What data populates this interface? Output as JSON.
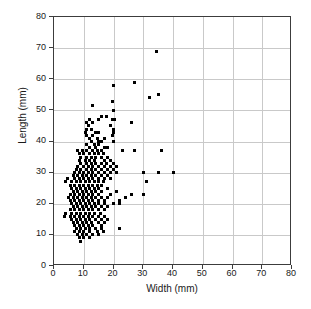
{
  "chart_data": {
    "type": "scatter",
    "title": "",
    "xlabel": "Width (mm)",
    "ylabel": "Length (mm)",
    "xlim": [
      0,
      80
    ],
    "ylim": [
      0,
      80
    ],
    "xticks": [
      0,
      10,
      20,
      30,
      40,
      50,
      60,
      70,
      80
    ],
    "yticks": [
      0,
      10,
      20,
      30,
      40,
      50,
      60,
      70,
      80
    ],
    "grid": true,
    "legend": null,
    "marker": {
      "shape": "square",
      "color": "#000000",
      "size_px": 3
    },
    "series": [
      {
        "name": "observations",
        "points": [
          [
            34.5,
            69
          ],
          [
            27,
            59
          ],
          [
            20,
            58
          ],
          [
            35,
            55
          ],
          [
            32,
            54
          ],
          [
            19.5,
            53
          ],
          [
            13,
            51.5
          ],
          [
            20,
            50
          ],
          [
            16,
            48
          ],
          [
            17.5,
            48
          ],
          [
            12,
            47
          ],
          [
            15,
            47
          ],
          [
            19.5,
            47
          ],
          [
            20.5,
            47
          ],
          [
            11,
            46
          ],
          [
            13,
            46
          ],
          [
            26,
            46
          ],
          [
            11.5,
            45
          ],
          [
            19,
            45
          ],
          [
            11,
            44
          ],
          [
            12.5,
            44
          ],
          [
            20,
            44
          ],
          [
            10.5,
            43
          ],
          [
            14,
            43
          ],
          [
            15,
            43
          ],
          [
            20,
            43
          ],
          [
            11,
            42
          ],
          [
            13,
            42
          ],
          [
            19.5,
            42
          ],
          [
            12,
            41
          ],
          [
            14.5,
            41
          ],
          [
            17,
            41
          ],
          [
            12.5,
            40
          ],
          [
            15,
            40
          ],
          [
            16,
            40
          ],
          [
            20,
            40
          ],
          [
            11,
            39
          ],
          [
            13.5,
            39
          ],
          [
            15,
            39
          ],
          [
            17,
            38
          ],
          [
            12,
            38
          ],
          [
            14,
            38
          ],
          [
            18,
            38
          ],
          [
            8,
            37
          ],
          [
            9.5,
            37
          ],
          [
            11,
            37
          ],
          [
            13,
            37
          ],
          [
            14.5,
            37
          ],
          [
            16,
            37
          ],
          [
            23,
            37
          ],
          [
            27,
            37
          ],
          [
            36,
            37
          ],
          [
            8.5,
            36
          ],
          [
            10,
            36
          ],
          [
            12,
            36
          ],
          [
            13.5,
            36
          ],
          [
            15,
            36
          ],
          [
            16.5,
            36
          ],
          [
            9,
            35
          ],
          [
            11,
            35
          ],
          [
            12.5,
            35
          ],
          [
            14,
            35
          ],
          [
            16,
            35
          ],
          [
            18,
            35
          ],
          [
            8.5,
            34
          ],
          [
            10.5,
            34
          ],
          [
            12,
            34
          ],
          [
            13.5,
            34
          ],
          [
            17,
            34
          ],
          [
            19,
            34
          ],
          [
            9,
            33
          ],
          [
            11,
            33
          ],
          [
            12.5,
            33
          ],
          [
            14,
            33
          ],
          [
            16,
            33
          ],
          [
            17.5,
            33
          ],
          [
            20,
            33
          ],
          [
            8,
            32
          ],
          [
            10,
            32
          ],
          [
            11.5,
            32
          ],
          [
            13,
            32
          ],
          [
            15,
            32
          ],
          [
            17,
            32
          ],
          [
            19,
            32
          ],
          [
            21,
            32
          ],
          [
            7.5,
            31
          ],
          [
            9,
            31
          ],
          [
            11,
            31
          ],
          [
            12.5,
            31
          ],
          [
            14,
            31
          ],
          [
            16,
            31
          ],
          [
            18,
            31
          ],
          [
            20,
            31
          ],
          [
            7,
            30
          ],
          [
            8.5,
            30
          ],
          [
            10,
            30
          ],
          [
            11.5,
            30
          ],
          [
            13,
            30
          ],
          [
            15,
            30
          ],
          [
            17,
            30
          ],
          [
            19,
            30
          ],
          [
            21,
            30
          ],
          [
            30,
            30
          ],
          [
            35,
            30
          ],
          [
            40,
            30
          ],
          [
            6.5,
            29
          ],
          [
            8,
            29
          ],
          [
            9.5,
            29
          ],
          [
            11,
            29
          ],
          [
            12.5,
            29
          ],
          [
            14,
            29
          ],
          [
            16,
            29
          ],
          [
            18,
            29
          ],
          [
            4.5,
            28
          ],
          [
            7,
            28
          ],
          [
            8.5,
            28
          ],
          [
            10,
            28
          ],
          [
            11.5,
            28
          ],
          [
            13,
            28
          ],
          [
            15,
            28
          ],
          [
            17,
            28
          ],
          [
            19,
            28
          ],
          [
            31,
            27
          ],
          [
            4,
            27
          ],
          [
            6,
            27
          ],
          [
            7.5,
            27
          ],
          [
            9,
            27
          ],
          [
            10.5,
            27
          ],
          [
            12,
            27
          ],
          [
            13.5,
            27
          ],
          [
            15,
            27
          ],
          [
            16.5,
            27
          ],
          [
            5.5,
            26
          ],
          [
            7,
            26
          ],
          [
            8.5,
            26
          ],
          [
            10,
            26
          ],
          [
            11.5,
            26
          ],
          [
            13,
            26
          ],
          [
            14.5,
            26
          ],
          [
            16,
            26
          ],
          [
            6,
            25
          ],
          [
            7.5,
            25
          ],
          [
            9,
            25
          ],
          [
            10.5,
            25
          ],
          [
            12,
            25
          ],
          [
            13.5,
            25
          ],
          [
            15,
            25
          ],
          [
            18,
            25
          ],
          [
            6.5,
            24
          ],
          [
            8,
            24
          ],
          [
            9.5,
            24
          ],
          [
            11,
            24
          ],
          [
            12.5,
            24
          ],
          [
            14,
            24
          ],
          [
            16,
            24
          ],
          [
            21,
            24
          ],
          [
            30,
            23
          ],
          [
            5.5,
            23
          ],
          [
            7,
            23
          ],
          [
            8.5,
            23
          ],
          [
            10,
            23
          ],
          [
            11.5,
            23
          ],
          [
            13,
            23
          ],
          [
            15,
            23
          ],
          [
            19,
            23
          ],
          [
            26,
            23
          ],
          [
            5,
            22
          ],
          [
            6.5,
            22
          ],
          [
            8,
            22
          ],
          [
            9.5,
            22
          ],
          [
            11,
            22
          ],
          [
            12.5,
            22
          ],
          [
            14,
            22
          ],
          [
            16,
            22
          ],
          [
            18,
            22
          ],
          [
            24,
            22
          ],
          [
            5.5,
            21
          ],
          [
            7,
            21
          ],
          [
            8.5,
            21
          ],
          [
            10,
            21
          ],
          [
            11.5,
            21
          ],
          [
            13,
            21
          ],
          [
            15,
            21
          ],
          [
            17,
            21
          ],
          [
            22,
            21
          ],
          [
            6,
            20
          ],
          [
            7.5,
            20
          ],
          [
            9,
            20
          ],
          [
            10.5,
            20
          ],
          [
            12,
            20
          ],
          [
            13.5,
            20
          ],
          [
            15,
            20
          ],
          [
            17,
            20
          ],
          [
            20,
            20
          ],
          [
            22,
            20
          ],
          [
            6.5,
            19
          ],
          [
            8,
            19
          ],
          [
            9.5,
            19
          ],
          [
            11,
            19
          ],
          [
            12.5,
            19
          ],
          [
            14,
            19
          ],
          [
            16,
            19
          ],
          [
            18,
            19
          ],
          [
            5.5,
            18
          ],
          [
            7,
            18
          ],
          [
            8.5,
            18
          ],
          [
            10,
            18
          ],
          [
            11.5,
            18
          ],
          [
            13,
            18
          ],
          [
            15,
            18
          ],
          [
            17,
            18
          ],
          [
            4,
            17
          ],
          [
            6,
            17
          ],
          [
            7.5,
            17
          ],
          [
            9,
            17
          ],
          [
            10.5,
            17
          ],
          [
            12,
            17
          ],
          [
            13.5,
            17
          ],
          [
            15.5,
            17
          ],
          [
            3.5,
            16
          ],
          [
            5.5,
            16
          ],
          [
            7,
            16
          ],
          [
            8.5,
            16
          ],
          [
            10,
            16
          ],
          [
            11.5,
            16
          ],
          [
            13,
            16
          ],
          [
            15,
            16
          ],
          [
            17,
            16
          ],
          [
            6,
            15
          ],
          [
            7.5,
            15
          ],
          [
            9,
            15
          ],
          [
            10.5,
            15
          ],
          [
            12,
            15
          ],
          [
            14,
            15
          ],
          [
            16,
            15
          ],
          [
            18,
            15
          ],
          [
            6.5,
            14
          ],
          [
            8,
            14
          ],
          [
            9.5,
            14
          ],
          [
            11,
            14
          ],
          [
            12.5,
            14
          ],
          [
            15,
            14
          ],
          [
            17,
            14
          ],
          [
            7,
            13
          ],
          [
            8.5,
            13
          ],
          [
            10,
            13
          ],
          [
            11.5,
            13
          ],
          [
            13,
            13
          ],
          [
            16,
            13
          ],
          [
            22,
            12
          ],
          [
            7.5,
            12
          ],
          [
            9,
            12
          ],
          [
            10.5,
            12
          ],
          [
            12,
            12
          ],
          [
            14,
            12
          ],
          [
            16,
            12
          ],
          [
            7,
            11
          ],
          [
            8.5,
            11
          ],
          [
            10,
            11
          ],
          [
            12,
            11
          ],
          [
            14.5,
            11
          ],
          [
            16.5,
            11
          ],
          [
            8,
            10
          ],
          [
            9.5,
            10
          ],
          [
            11,
            10
          ],
          [
            13,
            10
          ],
          [
            15,
            10
          ],
          [
            8.5,
            9
          ],
          [
            10,
            9
          ],
          [
            12,
            9
          ],
          [
            9,
            8
          ]
        ]
      }
    ]
  }
}
